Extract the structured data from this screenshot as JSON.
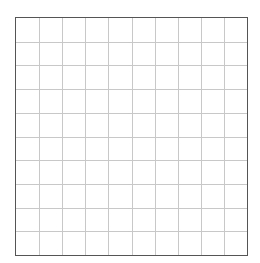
{
  "grid": {
    "rows": 10,
    "columns": 10,
    "border_color": "#555555",
    "line_color": "#c8c8c8",
    "background": "#ffffff"
  }
}
